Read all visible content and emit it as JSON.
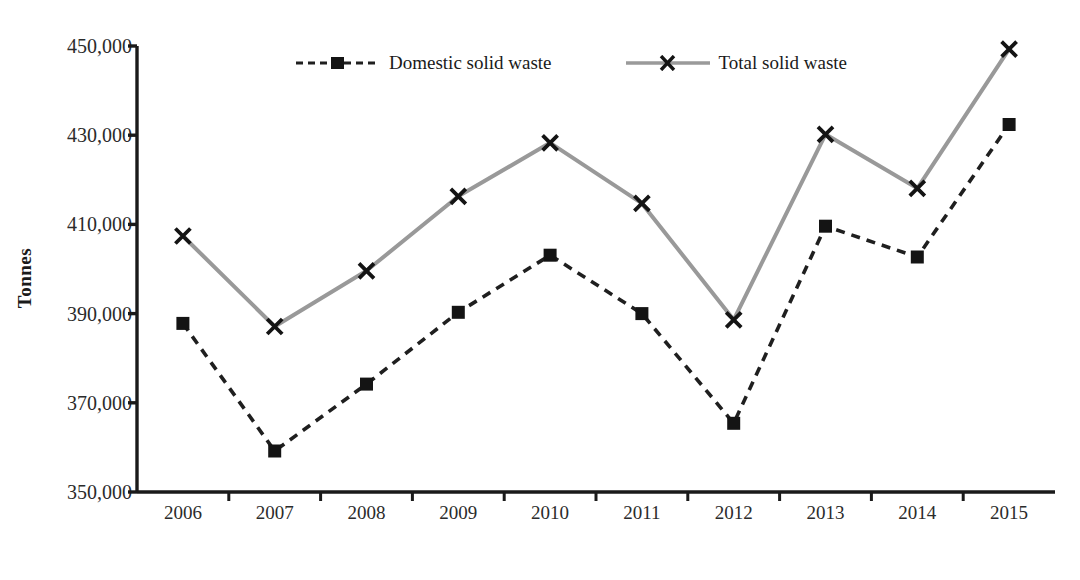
{
  "chart_data": {
    "type": "line",
    "title": "",
    "subtitle": "",
    "xlabel": "",
    "ylabel": "Tonnes",
    "categories": [
      "2006",
      "2007",
      "2008",
      "2009",
      "2010",
      "2011",
      "2012",
      "2013",
      "2014",
      "2015"
    ],
    "x": [
      2006,
      2007,
      2008,
      2009,
      2010,
      2011,
      2012,
      2013,
      2014,
      2015
    ],
    "series": [
      {
        "name": "Domestic solid waste",
        "marker": "square",
        "line_style": "dashed",
        "color": "#1f1f1f",
        "values": [
          387800,
          359200,
          374200,
          390300,
          403100,
          390000,
          365400,
          409600,
          402700,
          432400
        ]
      },
      {
        "name": "Total solid waste",
        "marker": "x",
        "line_style": "solid",
        "color": "#999999",
        "values": [
          407400,
          387100,
          399600,
          416300,
          428300,
          414700,
          388600,
          430200,
          418100,
          449300
        ]
      }
    ],
    "ylim": [
      350000,
      450000
    ],
    "yticks": [
      350000,
      370000,
      390000,
      410000,
      430000,
      450000
    ],
    "ytick_labels": [
      "350,000",
      "370,000",
      "390,000",
      "410,000",
      "430,000",
      "450,000"
    ],
    "grid": false,
    "legend_position": "top-center",
    "axis_color": "#1a1a1a"
  }
}
